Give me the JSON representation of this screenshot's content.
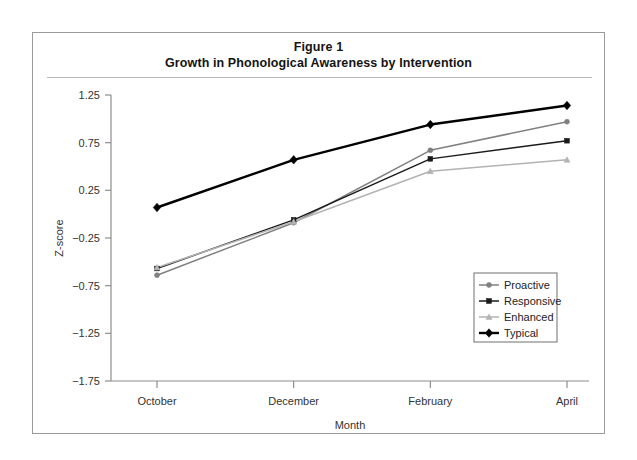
{
  "figure": {
    "title_line1": "Figure 1",
    "title_line2": "Growth in Phonological Awareness by Intervention"
  },
  "chart_data": {
    "type": "line",
    "title": "Growth in Phonological Awareness by Intervention",
    "subtitle": "Figure 1",
    "xlabel": "Month",
    "ylabel": "Z-score",
    "categories": [
      "October",
      "December",
      "February",
      "April"
    ],
    "ylim": [
      -1.75,
      1.25
    ],
    "yticks": [
      1.25,
      0.75,
      0.25,
      -0.25,
      -0.75,
      -1.25,
      -1.75
    ],
    "ytick_labels": [
      "1.25",
      "0.75",
      "0.25",
      "−0.25",
      "−0.75",
      "−1.25",
      "−1.75"
    ],
    "grid": false,
    "legend_position": "lower right",
    "series": [
      {
        "name": "Proactive",
        "marker": "circle",
        "color": "#808080",
        "values": [
          -0.64,
          -0.09,
          0.67,
          0.97
        ]
      },
      {
        "name": "Responsive",
        "marker": "square",
        "color": "#1a1a1a",
        "values": [
          -0.57,
          -0.06,
          0.58,
          0.77
        ]
      },
      {
        "name": "Enhanced",
        "marker": "triangle",
        "color": "#b3b3b3",
        "values": [
          -0.56,
          -0.08,
          0.45,
          0.57
        ]
      },
      {
        "name": "Typical",
        "marker": "diamond",
        "color": "#000000",
        "values": [
          0.07,
          0.57,
          0.94,
          1.14
        ]
      }
    ]
  },
  "axis": {
    "y_title": "Z-score",
    "x_title": "Month"
  }
}
